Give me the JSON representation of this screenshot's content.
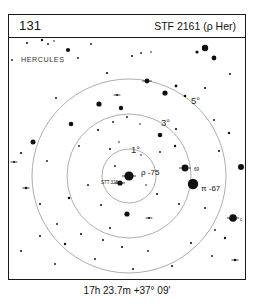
{
  "header": {
    "chart_number": "131",
    "title": "STF 2161 (ρ Her)"
  },
  "caption": {
    "coordinates": "17h 23.7m  +37° 09'"
  },
  "sky": {
    "constellation": "HERCULES",
    "ring_labels": [
      {
        "text": "1°",
        "x": 122,
        "y": 107
      },
      {
        "text": "3°",
        "x": 152,
        "y": 80
      },
      {
        "text": "5°",
        "x": 182,
        "y": 58
      }
    ],
    "star_labels": [
      {
        "name": "rho-75-label",
        "text": "ρ -75",
        "x": 132,
        "y": 131,
        "size": "star-label"
      },
      {
        "name": "stt328-label",
        "text": "STT 328",
        "x": 92,
        "y": 143,
        "size": "star-label-small"
      },
      {
        "name": "star-69-label",
        "text": "69",
        "x": 185,
        "y": 130,
        "size": "star-label-small"
      },
      {
        "name": "pi-67-label",
        "text": "π -67",
        "x": 192,
        "y": 147,
        "size": "star-label"
      },
      {
        "name": "star-c-label",
        "text": "c",
        "x": 231,
        "y": 180,
        "size": "star-label-small"
      }
    ]
  },
  "chart_data": {
    "type": "scatter",
    "title": "STF 2161 (ρ Her)",
    "subtitle": "Chart 131",
    "xlabel": "",
    "ylabel": "",
    "center_label": "ρ -75",
    "center": {
      "x": 120,
      "y": 138
    },
    "rings": [
      {
        "label": "1°",
        "radius": 27
      },
      {
        "label": "3°",
        "radius": 62
      },
      {
        "label": "5°",
        "radius": 97
      }
    ],
    "stars": [
      {
        "x": 120,
        "y": 138,
        "r": 4.6,
        "type": "double",
        "label": "ρ -75"
      },
      {
        "x": 111,
        "y": 145,
        "r": 2.6,
        "type": "double",
        "label": "STT 328"
      },
      {
        "x": 176,
        "y": 130,
        "r": 3.4,
        "type": "double",
        "label": "69"
      },
      {
        "x": 184,
        "y": 146,
        "r": 5.2,
        "type": "single",
        "label": "π -67"
      },
      {
        "x": 224,
        "y": 180,
        "r": 3.8,
        "type": "double",
        "label": "c"
      },
      {
        "x": 18,
        "y": 5,
        "r": 1.0,
        "type": "single"
      },
      {
        "x": 33,
        "y": 2,
        "r": 1.2,
        "type": "single"
      },
      {
        "x": 39,
        "y": 6,
        "r": 0.9,
        "type": "single"
      },
      {
        "x": 45,
        "y": 3,
        "r": 0.8,
        "type": "single"
      },
      {
        "x": 59,
        "y": 12,
        "r": 2.1,
        "type": "single"
      },
      {
        "x": 69,
        "y": 20,
        "r": 0.9,
        "type": "single"
      },
      {
        "x": 82,
        "y": 6,
        "r": 0.9,
        "type": "single"
      },
      {
        "x": 123,
        "y": 18,
        "r": 1.0,
        "type": "single"
      },
      {
        "x": 132,
        "y": 15,
        "r": 0.9,
        "type": "single"
      },
      {
        "x": 196,
        "y": 10,
        "r": 3.2,
        "type": "single"
      },
      {
        "x": 188,
        "y": 14,
        "r": 1.6,
        "type": "single"
      },
      {
        "x": 205,
        "y": 20,
        "r": 2.4,
        "type": "single"
      },
      {
        "x": 142,
        "y": 14,
        "r": 0.8,
        "type": "single"
      },
      {
        "x": 3,
        "y": 22,
        "r": 0.9,
        "type": "single"
      },
      {
        "x": 98,
        "y": 35,
        "r": 1.1,
        "type": "single"
      },
      {
        "x": 221,
        "y": 36,
        "r": 1.0,
        "type": "single"
      },
      {
        "x": 138,
        "y": 43,
        "r": 2.4,
        "type": "double"
      },
      {
        "x": 167,
        "y": 48,
        "r": 1.4,
        "type": "single"
      },
      {
        "x": 108,
        "y": 57,
        "r": 1.0,
        "type": "double"
      },
      {
        "x": 90,
        "y": 66,
        "r": 2.6,
        "type": "single"
      },
      {
        "x": 112,
        "y": 70,
        "r": 2.2,
        "type": "single"
      },
      {
        "x": 196,
        "y": 50,
        "r": 1.1,
        "type": "single"
      },
      {
        "x": 156,
        "y": 55,
        "r": 2.6,
        "type": "single"
      },
      {
        "x": 176,
        "y": 58,
        "r": 1.3,
        "type": "single"
      },
      {
        "x": 47,
        "y": 60,
        "r": 1.0,
        "type": "single"
      },
      {
        "x": 104,
        "y": 84,
        "r": 0.9,
        "type": "single"
      },
      {
        "x": 118,
        "y": 79,
        "r": 0.9,
        "type": "single"
      },
      {
        "x": 131,
        "y": 86,
        "r": 0.8,
        "type": "single"
      },
      {
        "x": 89,
        "y": 92,
        "r": 1.1,
        "type": "single"
      },
      {
        "x": 151,
        "y": 97,
        "r": 2.3,
        "type": "single"
      },
      {
        "x": 167,
        "y": 91,
        "r": 1.1,
        "type": "single"
      },
      {
        "x": 205,
        "y": 82,
        "r": 1.0,
        "type": "single"
      },
      {
        "x": 220,
        "y": 95,
        "r": 1.2,
        "type": "single"
      },
      {
        "x": 62,
        "y": 86,
        "r": 2.3,
        "type": "single"
      },
      {
        "x": 70,
        "y": 108,
        "r": 0.9,
        "type": "single"
      },
      {
        "x": 24,
        "y": 104,
        "r": 2.5,
        "type": "single"
      },
      {
        "x": 12,
        "y": 115,
        "r": 1.1,
        "type": "single"
      },
      {
        "x": 5,
        "y": 124,
        "r": 1.0,
        "type": "double"
      },
      {
        "x": 38,
        "y": 123,
        "r": 0.9,
        "type": "single"
      },
      {
        "x": 101,
        "y": 111,
        "r": 1.0,
        "type": "single"
      },
      {
        "x": 110,
        "y": 104,
        "r": 0.8,
        "type": "single"
      },
      {
        "x": 132,
        "y": 117,
        "r": 0.8,
        "type": "single"
      },
      {
        "x": 151,
        "y": 114,
        "r": 0.9,
        "type": "single"
      },
      {
        "x": 166,
        "y": 108,
        "r": 1.2,
        "type": "single"
      },
      {
        "x": 210,
        "y": 113,
        "r": 1.1,
        "type": "single"
      },
      {
        "x": 232,
        "y": 129,
        "r": 3.0,
        "type": "single"
      },
      {
        "x": 106,
        "y": 128,
        "r": 0.9,
        "type": "single"
      },
      {
        "x": 137,
        "y": 147,
        "r": 0.8,
        "type": "single"
      },
      {
        "x": 148,
        "y": 156,
        "r": 1.1,
        "type": "single"
      },
      {
        "x": 196,
        "y": 170,
        "r": 1.0,
        "type": "single"
      },
      {
        "x": 170,
        "y": 166,
        "r": 1.0,
        "type": "single"
      },
      {
        "x": 79,
        "y": 147,
        "r": 1.0,
        "type": "single"
      },
      {
        "x": 60,
        "y": 160,
        "r": 1.3,
        "type": "single"
      },
      {
        "x": 92,
        "y": 167,
        "r": 1.0,
        "type": "single"
      },
      {
        "x": 17,
        "y": 150,
        "r": 1.2,
        "type": "double"
      },
      {
        "x": 31,
        "y": 166,
        "r": 1.0,
        "type": "single"
      },
      {
        "x": 118,
        "y": 176,
        "r": 2.6,
        "type": "single"
      },
      {
        "x": 140,
        "y": 180,
        "r": 1.0,
        "type": "double"
      },
      {
        "x": 206,
        "y": 192,
        "r": 0.9,
        "type": "single"
      },
      {
        "x": 216,
        "y": 200,
        "r": 1.2,
        "type": "single"
      },
      {
        "x": 182,
        "y": 205,
        "r": 1.1,
        "type": "single"
      },
      {
        "x": 101,
        "y": 190,
        "r": 1.0,
        "type": "single"
      },
      {
        "x": 72,
        "y": 196,
        "r": 1.1,
        "type": "single"
      },
      {
        "x": 48,
        "y": 186,
        "r": 0.9,
        "type": "single"
      },
      {
        "x": 94,
        "y": 202,
        "r": 1.0,
        "type": "single"
      },
      {
        "x": 56,
        "y": 206,
        "r": 1.2,
        "type": "single"
      },
      {
        "x": 31,
        "y": 198,
        "r": 1.0,
        "type": "single"
      },
      {
        "x": 113,
        "y": 209,
        "r": 1.1,
        "type": "single"
      },
      {
        "x": 139,
        "y": 213,
        "r": 0.9,
        "type": "single"
      },
      {
        "x": 203,
        "y": 218,
        "r": 0.9,
        "type": "single"
      },
      {
        "x": 226,
        "y": 222,
        "r": 1.2,
        "type": "double"
      },
      {
        "x": 86,
        "y": 221,
        "r": 1.0,
        "type": "single"
      },
      {
        "x": 163,
        "y": 228,
        "r": 1.1,
        "type": "single"
      },
      {
        "x": 46,
        "y": 226,
        "r": 0.9,
        "type": "single"
      },
      {
        "x": 12,
        "y": 213,
        "r": 1.0,
        "type": "single"
      },
      {
        "x": 124,
        "y": 231,
        "r": 1.0,
        "type": "single"
      }
    ],
    "grid": false,
    "legend": null
  },
  "colors": {
    "ink": "#111111",
    "frame": "#1a1a1a",
    "ring": "#8a8a8a",
    "background": "#ffffff"
  }
}
